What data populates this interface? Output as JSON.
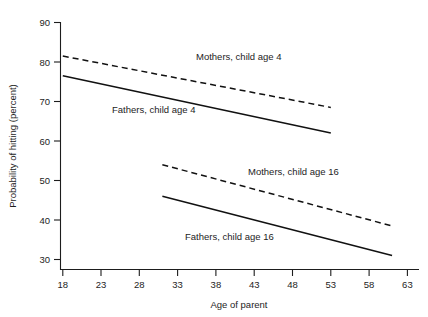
{
  "chart_data": {
    "type": "line",
    "title": "",
    "xlabel": "Age of parent",
    "ylabel": "Probability of hitting (percent)",
    "xlim": [
      16,
      64
    ],
    "ylim": [
      27,
      90
    ],
    "xticks": [
      18,
      23,
      28,
      33,
      38,
      43,
      48,
      53,
      58,
      63
    ],
    "yticks": [
      30,
      40,
      50,
      60,
      70,
      80,
      90
    ],
    "xtick_labels": [
      "18",
      "23",
      "28",
      "33",
      "38",
      "43",
      "48",
      "53",
      "58",
      "63"
    ],
    "ytick_labels": [
      "30",
      "40",
      "50",
      "60",
      "70",
      "80",
      "90"
    ],
    "grid": false,
    "legend": "inline annotations",
    "series": [
      {
        "name": "Mothers, child age 4",
        "style": "dashed",
        "x": [
          18,
          53
        ],
        "values": [
          81.5,
          68.5
        ],
        "annotation": "Mothers, child age 4",
        "annotation_x": 33.5,
        "annotation_y": 79.5
      },
      {
        "name": "Fathers, child age 4",
        "style": "solid",
        "x": [
          18,
          53
        ],
        "values": [
          76.5,
          62.0
        ],
        "annotation": "Fathers, child age 4",
        "annotation_x": 22.5,
        "annotation_y": 66.5
      },
      {
        "name": "Mothers, child age 16",
        "style": "dashed",
        "x": [
          31,
          61
        ],
        "values": [
          54.0,
          38.5
        ],
        "annotation": "Mothers, child age 16",
        "annotation_x": 41.5,
        "annotation_y": 51.5
      },
      {
        "name": "Fathers, child age 16",
        "style": "solid",
        "x": [
          31,
          61
        ],
        "values": [
          46.0,
          31.0
        ],
        "annotation": "Fathers, child age 16",
        "annotation_x": 33.5,
        "annotation_y": 35.5
      }
    ]
  },
  "axes": {
    "x_title": "Age of parent",
    "y_title": "Probability of hitting (percent)",
    "x_labels": [
      "18",
      "23",
      "28",
      "33",
      "38",
      "43",
      "48",
      "53",
      "58",
      "63"
    ],
    "y_labels": [
      "90",
      "80",
      "70",
      "60",
      "50",
      "40",
      "30"
    ]
  },
  "annotations": {
    "mothers_child_age_4": "Mothers, child age 4",
    "fathers_child_age_4": "Fathers, child age 4",
    "mothers_child_age_16": "Mothers, child age 16",
    "fathers_child_age_16": "Fathers, child age 16"
  },
  "colors": {
    "line": "#111111",
    "axis": "#1d1d1d",
    "background": "#ffffff",
    "text": "#1a1a1a"
  }
}
